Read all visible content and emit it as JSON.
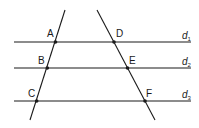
{
  "diagram": {
    "stroke_color": "#1a1a1a",
    "parallel_lines": [
      {
        "name": "d",
        "sub": "1",
        "y": 42
      },
      {
        "name": "d",
        "sub": "2",
        "y": 68
      },
      {
        "name": "d",
        "sub": "3",
        "y": 101
      }
    ],
    "transversals": [
      {
        "name": "left",
        "points": [
          "A",
          "B",
          "C"
        ]
      },
      {
        "name": "right",
        "points": [
          "D",
          "E",
          "F"
        ]
      }
    ],
    "points": {
      "A": "A",
      "B": "B",
      "C": "C",
      "D": "D",
      "E": "E",
      "F": "F"
    }
  }
}
